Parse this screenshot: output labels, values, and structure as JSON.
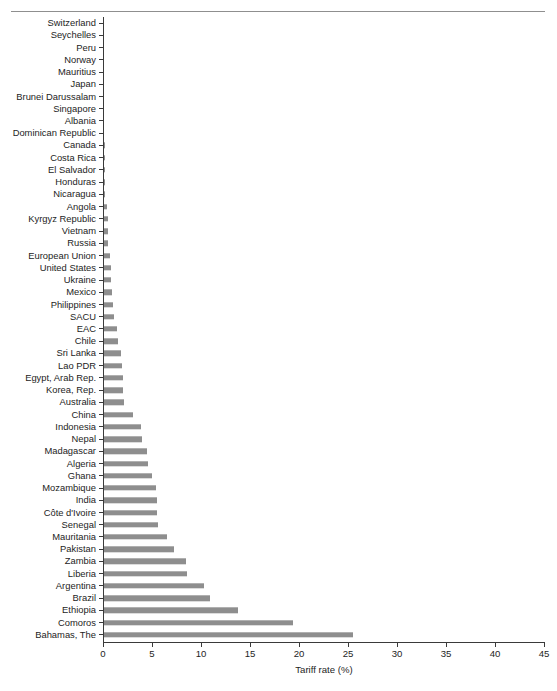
{
  "figure": {
    "has_top_rule": true,
    "bar_color": "#8e8e8e",
    "axis_color": "#3a3a3a"
  },
  "chart_data": {
    "type": "bar",
    "orientation": "horizontal",
    "title": "",
    "xlabel": "Tariff rate (%)",
    "ylabel": "",
    "xlim": [
      0,
      45
    ],
    "xticks": [
      0,
      5,
      10,
      15,
      20,
      25,
      30,
      35,
      40,
      45
    ],
    "xtick_labels": [
      "0",
      "5",
      "10",
      "15",
      "20",
      "25",
      "30",
      "35",
      "40",
      "45"
    ],
    "grid": false,
    "legend": false,
    "categories": [
      "Switzerland",
      "Seychelles",
      "Peru",
      "Norway",
      "Mauritius",
      "Japan",
      "Brunei Darussalam",
      "Singapore",
      "Albania",
      "Dominican Republic",
      "Canada",
      "Costa Rica",
      "El Salvador",
      "Honduras",
      "Nicaragua",
      "Angola",
      "Kyrgyz Republic",
      "Vietnam",
      "Russia",
      "European Union",
      "United States",
      "Ukraine",
      "Mexico",
      "Philippines",
      "SACU",
      "EAC",
      "Chile",
      "Sri Lanka",
      "Lao PDR",
      "Egypt, Arab Rep.",
      "Korea, Rep.",
      "Australia",
      "China",
      "Indonesia",
      "Nepal",
      "Madagascar",
      "Algeria",
      "Ghana",
      "Mozambique",
      "India",
      "Côte d'Ivoire",
      "Senegal",
      "Mauritania",
      "Pakistan",
      "Zambia",
      "Liberia",
      "Argentina",
      "Brazil",
      "Ethiopia",
      "Comoros",
      "Bahamas, The"
    ],
    "values": [
      0.0,
      0.0,
      0.0,
      0.0,
      0.0,
      0.0,
      0.0,
      0.0,
      0.0,
      0.0,
      0.05,
      0.05,
      0.05,
      0.1,
      0.1,
      0.3,
      0.4,
      0.4,
      0.4,
      0.6,
      0.7,
      0.7,
      0.8,
      0.9,
      1.0,
      1.3,
      1.4,
      1.7,
      1.8,
      1.9,
      1.9,
      2.0,
      3.0,
      3.8,
      3.9,
      4.4,
      4.5,
      4.9,
      5.3,
      5.4,
      5.4,
      5.5,
      6.4,
      7.1,
      8.4,
      8.5,
      10.2,
      10.8,
      13.7,
      19.3,
      25.4
    ]
  }
}
